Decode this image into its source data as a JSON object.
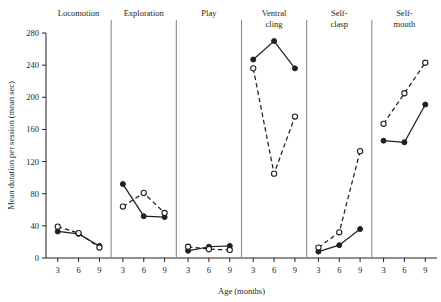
{
  "chart_data": {
    "type": "line",
    "title": "",
    "xlabel": "Age (months)",
    "ylabel": "Mean duration per session (mean sec)",
    "x": [
      3,
      6,
      9
    ],
    "xtick_labels": [
      "3",
      "6",
      "9"
    ],
    "ylim": [
      0,
      280
    ],
    "ytick_values": [
      0,
      40,
      80,
      120,
      160,
      200,
      240,
      280
    ],
    "ytick_labels": [
      "0",
      "40",
      "80",
      "120",
      "160",
      "200",
      "240",
      "280"
    ],
    "grid": false,
    "legend": "none",
    "panel_layout": "6 side-by-side panels sharing one y-axis",
    "series_styles": [
      {
        "name": "solid-filled-circle",
        "marker": "filled circle",
        "line": "solid"
      },
      {
        "name": "dashed-open-circle",
        "marker": "open circle",
        "line": "dashed"
      }
    ],
    "panels": [
      {
        "label": "Locomotion",
        "series": [
          {
            "name": "solid-filled-circle",
            "values": [
              33,
              30,
              15
            ]
          },
          {
            "name": "dashed-open-circle",
            "values": [
              39,
              31,
              13
            ]
          }
        ]
      },
      {
        "label": "Exploration",
        "series": [
          {
            "name": "solid-filled-circle",
            "values": [
              92,
              52,
              51
            ]
          },
          {
            "name": "dashed-open-circle",
            "values": [
              64,
              81,
              56
            ]
          }
        ]
      },
      {
        "label": "Play",
        "series": [
          {
            "name": "solid-filled-circle",
            "values": [
              9,
              14,
              15
            ]
          },
          {
            "name": "dashed-open-circle",
            "values": [
              14,
              11,
              10
            ]
          }
        ]
      },
      {
        "label": "Ventral cling",
        "series": [
          {
            "name": "solid-filled-circle",
            "values": [
              247,
              270,
              236
            ]
          },
          {
            "name": "dashed-open-circle",
            "values": [
              236,
              105,
              176
            ]
          }
        ]
      },
      {
        "label": "Self-clasp",
        "series": [
          {
            "name": "solid-filled-circle",
            "values": [
              8,
              16,
              36
            ]
          },
          {
            "name": "dashed-open-circle",
            "values": [
              13,
              32,
              133
            ]
          }
        ]
      },
      {
        "label": "Self-mouth",
        "series": [
          {
            "name": "solid-filled-circle",
            "values": [
              146,
              144,
              191
            ]
          },
          {
            "name": "dashed-open-circle",
            "values": [
              167,
              205,
              243
            ]
          }
        ]
      }
    ]
  }
}
